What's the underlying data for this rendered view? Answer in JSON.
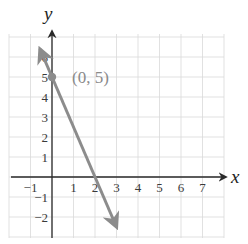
{
  "chart_data": {
    "type": "line",
    "title": "",
    "xlabel": "x",
    "ylabel": "y",
    "xlim": [
      -2,
      8
    ],
    "ylim": [
      -3,
      7
    ],
    "grid": true,
    "x_ticks": [
      -1,
      1,
      2,
      3,
      4,
      5,
      6,
      7
    ],
    "y_ticks": [
      -2,
      -1,
      1,
      2,
      3,
      4,
      5,
      6
    ],
    "x_tick_labels": [
      "−1",
      "1",
      "2",
      "3",
      "4",
      "5",
      "6",
      "7"
    ],
    "y_tick_labels": [
      "−2",
      "−1",
      "1",
      "2",
      "3",
      "4",
      "5",
      "6"
    ],
    "series": [
      {
        "name": "y = -2.5x + 5",
        "slope": -2.5,
        "intercept": 5,
        "x_range": [
          -0.56,
          3.0
        ],
        "arrows": "both",
        "color": "#8c8c8c"
      }
    ],
    "points": [
      {
        "x": 0,
        "y": 5,
        "label": "(0, 5)",
        "color": "#8c8c8c"
      }
    ],
    "annotations": [
      "(0, 5)"
    ]
  },
  "colors": {
    "grid": "#d9d9d9",
    "axis": "#2a2a2a",
    "line": "#8c8c8c",
    "point": "#8c8c8c"
  }
}
